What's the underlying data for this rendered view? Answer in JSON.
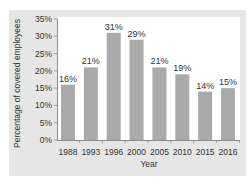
{
  "colors": {
    "panel": "#e6e6e6",
    "plot_bg": "#ffffff",
    "bar": "#aaaaaa",
    "axis": "#8c8c8c",
    "text": "#333333"
  },
  "chart_data": {
    "type": "bar",
    "title": "",
    "xlabel": "Year",
    "ylabel": "Percentage of covered employees",
    "categories": [
      "1988",
      "1993",
      "1996",
      "2000",
      "2005",
      "2010",
      "2015",
      "2016"
    ],
    "values": [
      16,
      21,
      31,
      29,
      21,
      19,
      14,
      15
    ],
    "data_labels": [
      "16%",
      "21%",
      "31%",
      "29%",
      "21%",
      "19%",
      "14%",
      "15%"
    ],
    "ylim": [
      0,
      35
    ],
    "yticks": [
      0,
      5,
      10,
      15,
      20,
      25,
      30,
      35
    ],
    "ytick_labels": [
      "0%",
      "5%",
      "10%",
      "15%",
      "20%",
      "25%",
      "30%",
      "35%"
    ],
    "grid": false,
    "legend": "none"
  }
}
